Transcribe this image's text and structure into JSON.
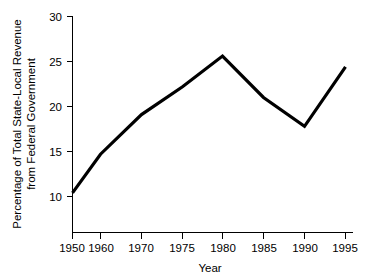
{
  "chart_data": {
    "type": "line",
    "title": "",
    "xlabel": "Year",
    "ylabel_line1": "Percentage of Total State-Local Revenue",
    "ylabel_line2": "from Federal Government",
    "categories": [
      "1950",
      "1960",
      "1970",
      "1975",
      "1980",
      "1985",
      "1990",
      "1995"
    ],
    "x": [
      1950,
      1960,
      1970,
      1975,
      1980,
      1985,
      1990,
      1995
    ],
    "values": [
      10.4,
      14.7,
      19.1,
      22.2,
      25.6,
      21.0,
      17.8,
      24.4
    ],
    "series": [
      {
        "name": "Percentage of Total State-Local Revenue from Federal Government",
        "values": [
          10.4,
          14.7,
          19.1,
          22.2,
          25.6,
          21.0,
          17.8,
          24.4
        ]
      }
    ],
    "yticks": [
      10,
      15,
      20,
      25,
      30
    ],
    "ytick_labels": [
      "10",
      "15",
      "20",
      "25",
      "30"
    ],
    "xtick_labels": [
      "1950",
      "1960",
      "1970",
      "1975",
      "1980",
      "1985",
      "1990",
      "1995"
    ],
    "ylim": [
      6,
      30
    ],
    "grid": false,
    "legend": false,
    "legend_position": "none",
    "line_color": "#000000",
    "background_color": "#ffffff",
    "axis_color": "#000000",
    "note": "x-axis spacing is non-uniform: decade steps 1950-1970, then five-year steps 1970-1995"
  },
  "axis": {
    "x_tick_0": "1950",
    "x_tick_1": "1960",
    "x_tick_2": "1970",
    "x_tick_3": "1975",
    "x_tick_4": "1980",
    "x_tick_5": "1985",
    "x_tick_6": "1990",
    "x_tick_7": "1995",
    "y_tick_0": "10",
    "y_tick_1": "15",
    "y_tick_2": "20",
    "y_tick_3": "25",
    "y_tick_4": "30"
  }
}
